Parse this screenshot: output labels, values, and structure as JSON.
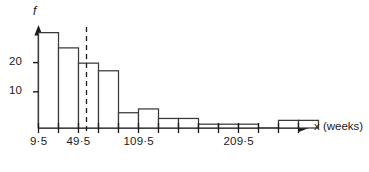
{
  "chart_data": {
    "type": "bar",
    "title": "",
    "xlabel": "x (weeks)",
    "ylabel": "f",
    "class_width": 20,
    "bin_start": 9.5,
    "categories": [
      "9.5-29.5",
      "29.5-49.5",
      "49.5-69.5",
      "69.5-89.5",
      "89.5-109.5",
      "109.5-129.5",
      "129.5-149.5",
      "149.5-169.5",
      "169.5-189.5",
      "189.5-209.5",
      "209.5-229.5",
      "229.5-249.5",
      "249.5-269.5",
      "269.5-289.5",
      "289.5-309.5",
      "309.5-329.5"
    ],
    "values": [
      25,
      21,
      17,
      15,
      4,
      5,
      2.5,
      2.5,
      1,
      1,
      1,
      0,
      2,
      2,
      0,
      0
    ],
    "ylim": [
      0,
      27
    ],
    "xlim": [
      9.5,
      329.5
    ],
    "grid": false,
    "legend": null,
    "y_ticks": [
      10,
      20
    ],
    "y_tick_labels": [
      "10",
      "20"
    ],
    "x_tick_labels": [
      {
        "value": 9.5,
        "text": "9·5"
      },
      {
        "value": 49.5,
        "text": "49·5"
      },
      {
        "value": 109.5,
        "text": "109·5"
      },
      {
        "value": 209.5,
        "text": "209·5"
      }
    ],
    "annotations": [
      {
        "type": "dashed-vertical-line",
        "name": "median-line",
        "value": 57.5,
        "label": ""
      }
    ]
  },
  "axes": {
    "y_axis_label": "f",
    "x_axis_label": "x (weeks)",
    "y_tick_20": "20",
    "y_tick_10": "10",
    "x_tick_1": "9·5",
    "x_tick_2": "49·5",
    "x_tick_3": "109·5",
    "x_tick_4": "209·5"
  },
  "style": {
    "ink": "#1a1a1a",
    "background": "#ffffff",
    "bar_fill": "#ffffff",
    "bar_stroke": "#3a3a3a"
  }
}
